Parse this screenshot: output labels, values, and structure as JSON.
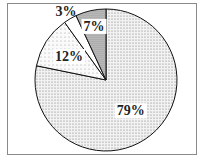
{
  "chart_data": {
    "type": "pie",
    "title": "",
    "start": "12 o'clock",
    "direction": "clockwise",
    "slices": [
      {
        "label": "79%",
        "value": 79,
        "pattern": "fine-dots",
        "color": "#e8e8e8"
      },
      {
        "label": "12%",
        "value": 12,
        "pattern": "sparse-dots",
        "color": "#f4f4f4"
      },
      {
        "label": "3%",
        "value": 3,
        "pattern": "none",
        "color": "#ffffff"
      },
      {
        "label": "7%",
        "value": 7,
        "pattern": "dense-dots",
        "color": "#bdbdbd"
      }
    ],
    "legend": "none"
  }
}
